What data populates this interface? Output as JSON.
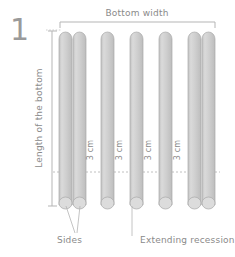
{
  "figure": {
    "step_number": "1",
    "type": "technical-craft-diagram"
  },
  "labels": {
    "bottom_width": "Bottom width",
    "length_of_bottom": "Length of the bottom",
    "sides": "Sides",
    "extending_recession": "Extending recession"
  },
  "gap_labels": [
    {
      "text": "3 cm"
    },
    {
      "text": "3 cm"
    },
    {
      "text": "3 cm"
    },
    {
      "text": "3 cm"
    }
  ],
  "colors": {
    "stick_fill": "#cccccc",
    "stick_fill_light": "#d8d8d8",
    "stick_stroke": "#a8a8a8",
    "text": "#8a8a8a",
    "dimension_line": "#b5b5b5",
    "dotted_line": "#c0c0c0",
    "background": "#ffffff",
    "step_number": "#9a9a9a"
  },
  "sticks": [
    {
      "name": "side-left-outer",
      "x": 59,
      "group": "pair-left"
    },
    {
      "name": "side-left-inner",
      "x": 73,
      "group": "pair-left"
    },
    {
      "name": "recession-1",
      "x": 101,
      "group": "single"
    },
    {
      "name": "recession-2",
      "x": 130,
      "group": "single"
    },
    {
      "name": "recession-3",
      "x": 159,
      "group": "single"
    },
    {
      "name": "side-right-inner",
      "x": 188,
      "group": "pair-right"
    },
    {
      "name": "side-right-outer",
      "x": 202,
      "group": "pair-right"
    }
  ],
  "geometry": {
    "stick_top_y": 32,
    "stick_bottom_y": 205,
    "stick_width": 13,
    "bracket_y": 22,
    "bracket_left_x": 60,
    "bracket_right_x": 215,
    "vdim_x": 52,
    "dotted_row_y": 172
  }
}
